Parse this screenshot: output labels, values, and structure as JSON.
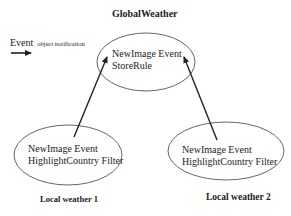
{
  "title": "GlobalWeather",
  "legend": {
    "event_word": "Event",
    "description": "object notification",
    "arrow_icon": "right-arrow-icon"
  },
  "nodes": {
    "global": {
      "label": "GlobalWeather",
      "line1": "NewImage Event",
      "line2": "StoreRule"
    },
    "local1": {
      "label": "Local weather 1",
      "line1": "NewImage Event",
      "line2": "HighlightCountry Filter"
    },
    "local2": {
      "label": "Local weather 2",
      "line1": "NewImage Event",
      "line2": "HighlightCountry Filter"
    }
  },
  "edges": [
    {
      "from": "local1",
      "to": "global"
    },
    {
      "from": "local2",
      "to": "global"
    }
  ],
  "colors": {
    "stroke": "#333333",
    "background": "#ffffff"
  }
}
